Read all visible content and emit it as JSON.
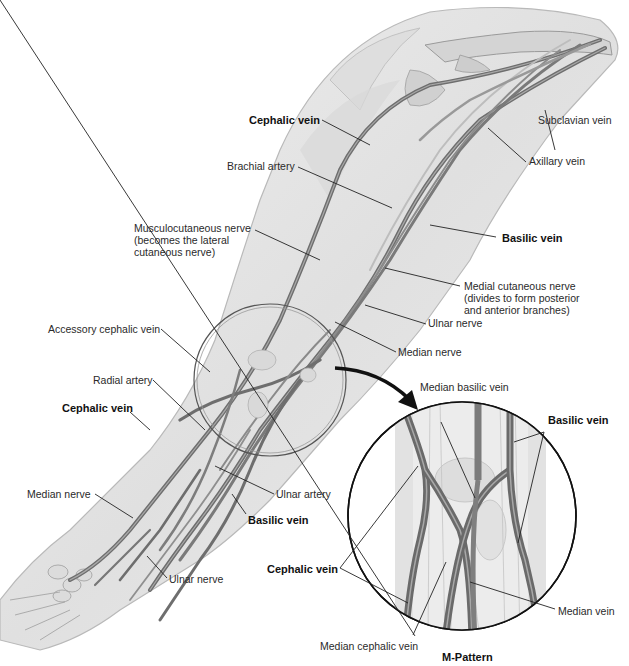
{
  "figure": {
    "colors": {
      "skin_fill": "#e4e4e4",
      "skin_edge": "#b5b5b5",
      "vein": "#6f6f6f",
      "vein_highlight": "#a8a8a8",
      "bone": "#d2d2d2",
      "leader_line": "#222222",
      "arrow": "#111111"
    },
    "main_labels": [
      {
        "id": "cephalic-vein-upper",
        "text": "Cephalic vein",
        "bold": true
      },
      {
        "id": "brachial-artery",
        "text": "Brachial artery",
        "bold": false
      },
      {
        "id": "subclavian-vein",
        "text": "Subclavian vein",
        "bold": false
      },
      {
        "id": "axillary-vein",
        "text": "Axillary vein",
        "bold": false
      },
      {
        "id": "basilic-vein-upper",
        "text": "Basilic vein",
        "bold": true
      },
      {
        "id": "musculocutaneous-nerve",
        "text": "Musculocutaneous nerve\n(becomes the lateral\ncutaneous nerve)",
        "bold": false
      },
      {
        "id": "medial-cutaneous-nerve",
        "text": "Medial cutaneous nerve\n(divides to form posterior\nand anterior branches)",
        "bold": false
      },
      {
        "id": "ulnar-nerve-upper",
        "text": "Ulnar nerve",
        "bold": false
      },
      {
        "id": "median-nerve-upper",
        "text": "Median nerve",
        "bold": false
      },
      {
        "id": "accessory-cephalic-vein",
        "text": "Accessory cephalic vein",
        "bold": false
      },
      {
        "id": "radial-artery",
        "text": "Radial artery",
        "bold": false
      },
      {
        "id": "cephalic-vein-forearm",
        "text": "Cephalic vein",
        "bold": true
      },
      {
        "id": "median-nerve-lower",
        "text": "Median nerve",
        "bold": false
      },
      {
        "id": "ulnar-artery",
        "text": "Ulnar artery",
        "bold": false
      },
      {
        "id": "basilic-vein-forearm",
        "text": "Basilic vein",
        "bold": true
      },
      {
        "id": "ulnar-nerve-lower",
        "text": "Ulnar nerve",
        "bold": false
      }
    ],
    "inset": {
      "title": "M-Pattern",
      "labels": [
        {
          "id": "median-basilic-vein",
          "text": "Median basilic vein",
          "bold": false
        },
        {
          "id": "basilic-vein-inset",
          "text": "Basilic vein",
          "bold": true
        },
        {
          "id": "cephalic-vein-inset",
          "text": "Cephalic vein",
          "bold": true
        },
        {
          "id": "median-vein",
          "text": "Median vein",
          "bold": false
        },
        {
          "id": "median-cephalic-vein",
          "text": "Median cephalic vein",
          "bold": false
        }
      ]
    }
  }
}
